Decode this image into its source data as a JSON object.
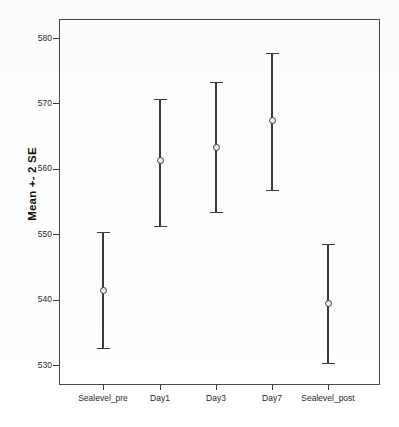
{
  "chart_data": {
    "type": "scatter",
    "title": "",
    "xlabel": "",
    "ylabel": "Mean +- 2 SE",
    "categories": [
      "Sealevel_pre",
      "Day1",
      "Day3",
      "Day7",
      "Sealevel_post"
    ],
    "y_ticks": [
      530,
      540,
      550,
      560,
      570,
      580
    ],
    "ylim": [
      526,
      582
    ],
    "grid": false,
    "legend": null,
    "error_type": "Mean +- 2 SE",
    "series": [
      {
        "name": "Mean +- 2 SE",
        "values": [
          541.4,
          561.3,
          563.2,
          567.4,
          539.4
        ],
        "lower": [
          532.6,
          551.3,
          553.4,
          556.8,
          530.3
        ],
        "upper": [
          550.4,
          570.7,
          573.3,
          577.7,
          548.5
        ]
      }
    ],
    "points": [
      {
        "category": "Sealevel_pre",
        "mean": 541.4,
        "lower": 532.6,
        "upper": 550.4
      },
      {
        "category": "Day1",
        "mean": 561.3,
        "lower": 551.3,
        "upper": 570.7
      },
      {
        "category": "Day3",
        "mean": 563.2,
        "lower": 553.4,
        "upper": 573.3
      },
      {
        "category": "Day7",
        "mean": 567.4,
        "lower": 556.8,
        "upper": 577.7
      },
      {
        "category": "Sealevel_post",
        "mean": 539.4,
        "lower": 530.3,
        "upper": 548.5
      }
    ]
  },
  "axis": {
    "y_title": "Mean +- 2 SE",
    "y_tick_labels": [
      "580",
      "570",
      "560",
      "550",
      "540",
      "530"
    ],
    "x_tick_labels": [
      "Sealevel_pre",
      "Day1",
      "Day3",
      "Day7",
      "Sealevel_post"
    ]
  },
  "caption": {
    "text": ""
  },
  "colors": {
    "frame": "#4a4a4a",
    "marker_edge": "#3b3b3b",
    "marker_fill": "#efefef",
    "whisker": "#3b3b3b",
    "text": "#2a2a2a",
    "background": "#ffffff"
  }
}
